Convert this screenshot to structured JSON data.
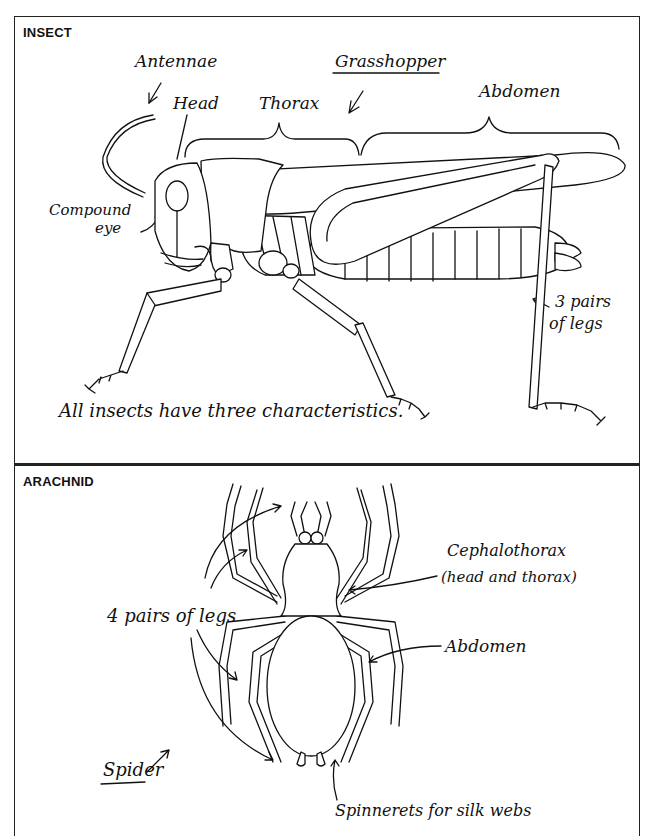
{
  "insect_panel": {
    "heading": "INSECT",
    "title_label": "Grasshopper",
    "labels": {
      "antennae": "Antennae",
      "head": "Head",
      "thorax": "Thorax",
      "abdomen": "Abdomen",
      "compound_eye_line1": "Compound",
      "compound_eye_line2": "eye",
      "legs_line1": "3 pairs",
      "legs_line2": "of legs"
    },
    "caption": "All insects have three characteristics."
  },
  "arachnid_panel": {
    "heading": "ARACHNID",
    "title_label": "Spider",
    "labels": {
      "legs": "4 pairs of legs",
      "cephalothorax_line1": "Cephalothorax",
      "cephalothorax_line2": "(head and thorax)",
      "abdomen": "Abdomen",
      "spinnerets": "Spinnerets for silk webs"
    }
  },
  "colors": {
    "ink": "#111111",
    "paper": "#ffffff"
  }
}
